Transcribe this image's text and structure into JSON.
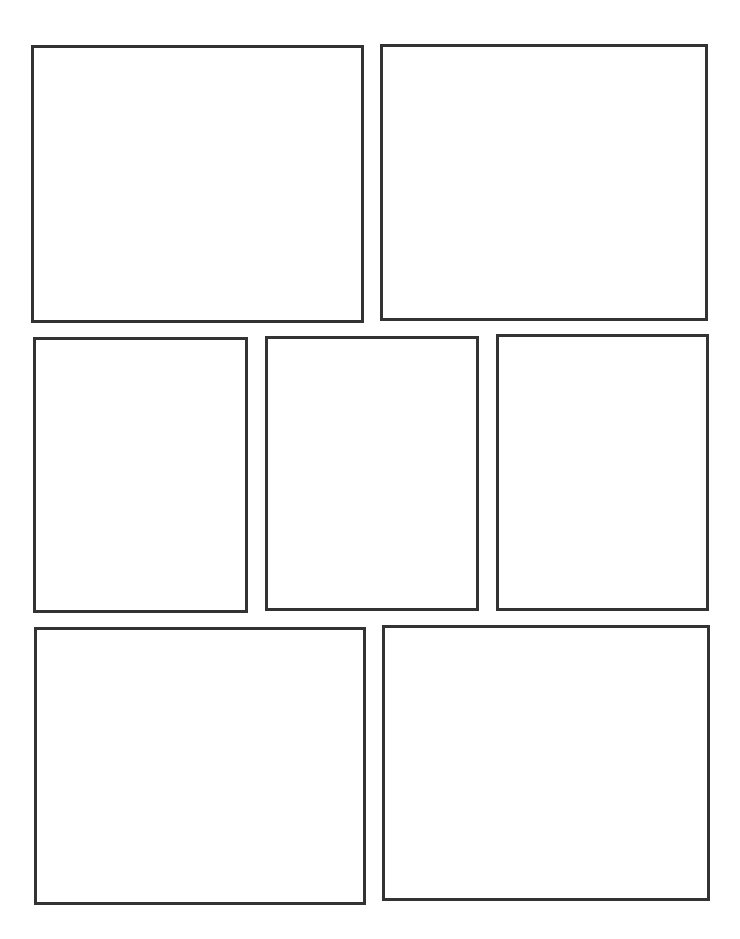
{
  "page": {
    "type": "comic-panel-template",
    "background": "#ffffff",
    "border_color": "#333333",
    "rows": [
      {
        "panels": [
          {
            "id": "panel-1",
            "x": 31,
            "y": 45,
            "w": 333,
            "h": 278
          },
          {
            "id": "panel-2",
            "x": 380,
            "y": 44,
            "w": 328,
            "h": 277
          }
        ]
      },
      {
        "panels": [
          {
            "id": "panel-3",
            "x": 33,
            "y": 337,
            "w": 215,
            "h": 276
          },
          {
            "id": "panel-4",
            "x": 265,
            "y": 336,
            "w": 214,
            "h": 275
          },
          {
            "id": "panel-5",
            "x": 496,
            "y": 334,
            "w": 213,
            "h": 277
          }
        ]
      },
      {
        "panels": [
          {
            "id": "panel-6",
            "x": 34,
            "y": 627,
            "w": 332,
            "h": 278
          },
          {
            "id": "panel-7",
            "x": 382,
            "y": 625,
            "w": 328,
            "h": 276
          }
        ]
      }
    ]
  }
}
